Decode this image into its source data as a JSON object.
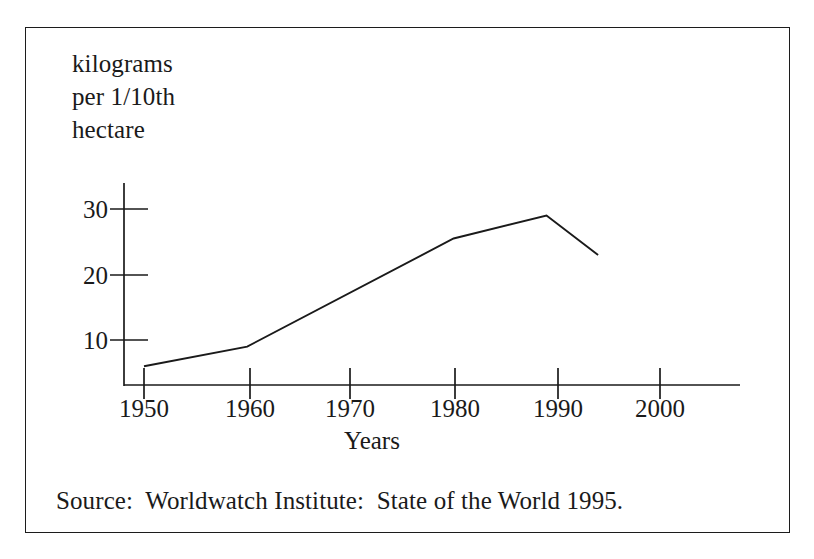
{
  "figure": {
    "frame_color": "#1c1c1c",
    "background": "#ffffff",
    "ink_color": "#1a1a1a",
    "y_caption_line1": "kilograms",
    "y_caption_line2": "per 1/10th",
    "y_caption_line3": "hectare",
    "source_note": "Source:  Worldwatch Institute:  State of the World 1995."
  },
  "chart_data": {
    "type": "line",
    "title": "",
    "subtitle": "",
    "xlabel": "Years",
    "ylabel": "kilograms per 1/10th hectare",
    "x": [
      1950,
      1960,
      1980,
      1989,
      1994
    ],
    "values": [
      6,
      9,
      25.5,
      29,
      23
    ],
    "series": [
      {
        "name": "fertilizer use per 1/10th hectare",
        "x": [
          1950,
          1960,
          1980,
          1989,
          1994
        ],
        "values": [
          6,
          9,
          25.5,
          29,
          23
        ]
      }
    ],
    "xlim": [
      1950,
      2009
    ],
    "ylim": [
      3,
      34
    ],
    "xticks": [
      1950,
      1960,
      1970,
      1980,
      1990,
      2000
    ],
    "xticklabels": [
      "1950",
      "1960",
      "1970",
      "1980",
      "1990",
      "2000"
    ],
    "yticks": [
      10,
      20,
      30
    ],
    "yticklabels": [
      "10",
      "20",
      "30"
    ],
    "grid": false,
    "legend": false,
    "annotations": [
      "Source:  Worldwatch Institute:  State of the World 1995."
    ]
  }
}
